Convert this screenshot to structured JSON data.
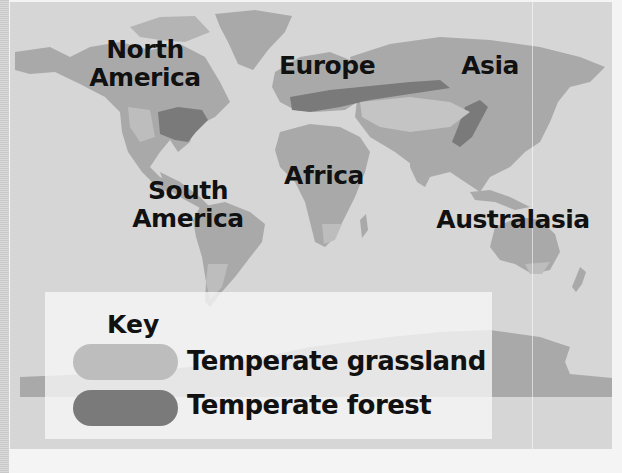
{
  "map": {
    "colors": {
      "ocean": "#d6d6d6",
      "land": "#a9a9a9",
      "grassland": "#bdbdbd",
      "forest": "#7a7a7a",
      "legend_bg": "#f7f7f7",
      "text": "#111111"
    },
    "regions": [
      {
        "id": "north-america",
        "line1": "North",
        "line2": "America"
      },
      {
        "id": "europe",
        "line1": "Europe"
      },
      {
        "id": "asia",
        "line1": "Asia"
      },
      {
        "id": "africa",
        "line1": "Africa"
      },
      {
        "id": "south-america",
        "line1": "South",
        "line2": "America"
      },
      {
        "id": "australasia",
        "line1": "Australasia"
      }
    ]
  },
  "legend": {
    "title": "Key",
    "items": [
      {
        "label": "Temperate grassland",
        "color": "#bdbdbd"
      },
      {
        "label": "Temperate forest",
        "color": "#7a7a7a"
      }
    ]
  }
}
